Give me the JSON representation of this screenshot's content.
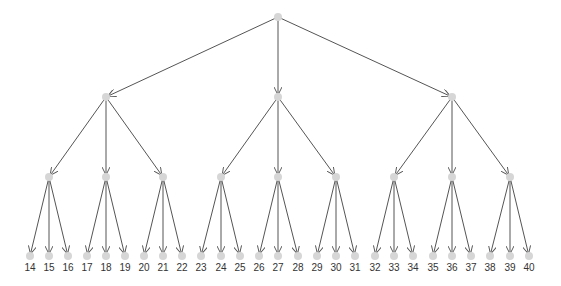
{
  "diagram": {
    "type": "tree",
    "colors": {
      "edge": "#555555",
      "node": "#d6d6d6",
      "label": "#333333"
    },
    "root": {
      "x": 278,
      "y": 17
    },
    "level1": [
      {
        "x": 106,
        "y": 97
      },
      {
        "x": 278,
        "y": 97
      },
      {
        "x": 452,
        "y": 97
      }
    ],
    "level2": [
      {
        "x": 49,
        "y": 177,
        "parent": 0
      },
      {
        "x": 106,
        "y": 177,
        "parent": 0
      },
      {
        "x": 163,
        "y": 177,
        "parent": 0
      },
      {
        "x": 221,
        "y": 177,
        "parent": 1
      },
      {
        "x": 278,
        "y": 177,
        "parent": 1
      },
      {
        "x": 336,
        "y": 177,
        "parent": 1
      },
      {
        "x": 394,
        "y": 177,
        "parent": 2
      },
      {
        "x": 452,
        "y": 177,
        "parent": 2
      },
      {
        "x": 510,
        "y": 177,
        "parent": 2
      }
    ],
    "leaves": [
      {
        "label": "14",
        "x": 30,
        "parent": 0
      },
      {
        "label": "15",
        "x": 49,
        "parent": 0
      },
      {
        "label": "16",
        "x": 68,
        "parent": 0
      },
      {
        "label": "17",
        "x": 87,
        "parent": 1
      },
      {
        "label": "18",
        "x": 106,
        "parent": 1
      },
      {
        "label": "19",
        "x": 125,
        "parent": 1
      },
      {
        "label": "20",
        "x": 144,
        "parent": 2
      },
      {
        "label": "21",
        "x": 163,
        "parent": 2
      },
      {
        "label": "22",
        "x": 182,
        "parent": 2
      },
      {
        "label": "23",
        "x": 201,
        "parent": 3
      },
      {
        "label": "24",
        "x": 221,
        "parent": 3
      },
      {
        "label": "25",
        "x": 240,
        "parent": 3
      },
      {
        "label": "26",
        "x": 259,
        "parent": 4
      },
      {
        "label": "27",
        "x": 278,
        "parent": 4
      },
      {
        "label": "28",
        "x": 298,
        "parent": 4
      },
      {
        "label": "29",
        "x": 317,
        "parent": 5
      },
      {
        "label": "30",
        "x": 336,
        "parent": 5
      },
      {
        "label": "31",
        "x": 355,
        "parent": 5
      },
      {
        "label": "32",
        "x": 375,
        "parent": 6
      },
      {
        "label": "33",
        "x": 394,
        "parent": 6
      },
      {
        "label": "34",
        "x": 413,
        "parent": 6
      },
      {
        "label": "35",
        "x": 433,
        "parent": 7
      },
      {
        "label": "36",
        "x": 452,
        "parent": 7
      },
      {
        "label": "37",
        "x": 471,
        "parent": 7
      },
      {
        "label": "38",
        "x": 490,
        "parent": 8
      },
      {
        "label": "39",
        "x": 510,
        "parent": 8
      },
      {
        "label": "40",
        "x": 529,
        "parent": 8
      }
    ],
    "leaf_y": 256,
    "label_y": 271
  }
}
